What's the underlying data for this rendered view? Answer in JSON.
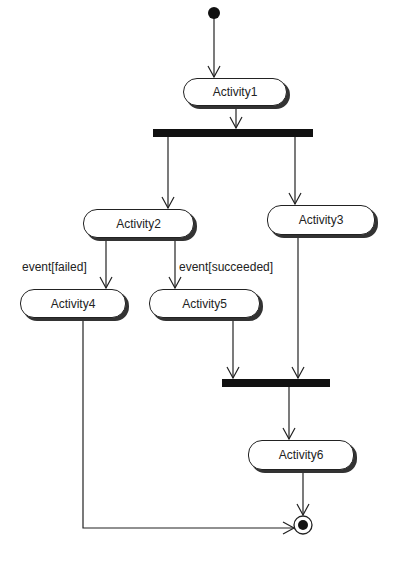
{
  "diagram": {
    "type": "UML activity diagram",
    "activities": [
      {
        "id": "a1",
        "label": "Activity1"
      },
      {
        "id": "a2",
        "label": "Activity2"
      },
      {
        "id": "a3",
        "label": "Activity3"
      },
      {
        "id": "a4",
        "label": "Activity4"
      },
      {
        "id": "a5",
        "label": "Activity5"
      },
      {
        "id": "a6",
        "label": "Activity6"
      }
    ],
    "guards": [
      {
        "from": "a2",
        "to": "a4",
        "label": "event[failed]"
      },
      {
        "from": "a2",
        "to": "a5",
        "label": "event[succeeded]"
      }
    ],
    "flows": [
      [
        "initial",
        "a1"
      ],
      [
        "a1",
        "fork"
      ],
      [
        "fork",
        "a2"
      ],
      [
        "fork",
        "a3"
      ],
      [
        "a2",
        "a4"
      ],
      [
        "a2",
        "a5"
      ],
      [
        "a5",
        "join"
      ],
      [
        "a3",
        "join"
      ],
      [
        "join",
        "a6"
      ],
      [
        "a6",
        "final"
      ],
      [
        "a4",
        "final"
      ]
    ]
  }
}
